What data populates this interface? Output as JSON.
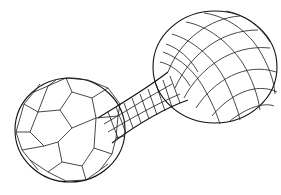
{
  "figure": {
    "line_color": "#1a1a1a",
    "background": "#ffffff",
    "parts": [
      {
        "name": "left-sphere",
        "mesh_style": "pentagon/hexagon tiling"
      },
      {
        "name": "connecting-neck",
        "mesh_style": "quad strip"
      },
      {
        "name": "right-sphere",
        "mesh_style": "lat-long quad grid"
      }
    ]
  }
}
